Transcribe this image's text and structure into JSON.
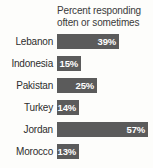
{
  "chart_data": {
    "type": "bar",
    "title": "Percent responding often or sometimes",
    "title_lines": [
      "Percent responding",
      "often or sometimes"
    ],
    "orientation": "horizontal",
    "categories": [
      "Lebanon",
      "Indonesia",
      "Pakistan",
      "Turkey",
      "Jordan",
      "Morocco"
    ],
    "values": [
      39,
      15,
      25,
      14,
      57,
      13
    ],
    "value_labels": [
      "39%",
      "15%",
      "25%",
      "14%",
      "57%",
      "13%"
    ],
    "xlabel": "",
    "ylabel": "",
    "xlim": [
      0,
      60
    ],
    "grid": false,
    "legend": "none",
    "bar_color": "#5b5b5b",
    "value_label_color": "#ffffff",
    "category_label_color": "#2e2e2e",
    "background_color": "#fdfdfb",
    "bars": [
      {
        "category": "Lebanon",
        "value": 39,
        "label": "39%"
      },
      {
        "category": "Indonesia",
        "value": 15,
        "label": "15%"
      },
      {
        "category": "Pakistan",
        "value": 25,
        "label": "25%"
      },
      {
        "category": "Turkey",
        "value": 14,
        "label": "14%"
      },
      {
        "category": "Jordan",
        "value": 57,
        "label": "57%"
      },
      {
        "category": "Morocco",
        "value": 13,
        "label": "13%"
      }
    ]
  }
}
